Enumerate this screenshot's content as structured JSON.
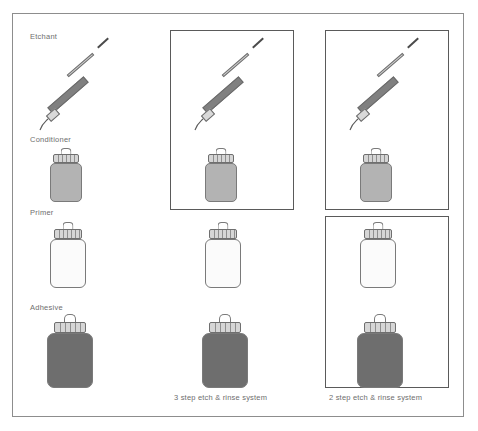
{
  "figure": {
    "title_visible": false,
    "border_color": "#8d8d8d",
    "background": "#ffffff"
  },
  "row_labels": [
    {
      "id": "etchant",
      "label": "Etchant"
    },
    {
      "id": "conditioner",
      "label": "Conditioner"
    },
    {
      "id": "primer",
      "label": "Primer"
    },
    {
      "id": "adhesive",
      "label": "Adhesive"
    }
  ],
  "columns": [
    {
      "id": "column-1",
      "caption": "",
      "boxed_groups": [],
      "items": [
        "etchant",
        "conditioner",
        "primer",
        "adhesive"
      ]
    },
    {
      "id": "column-2",
      "caption": "3 step etch & rinse system",
      "boxed_groups": [
        [
          "etchant",
          "conditioner"
        ]
      ],
      "items": [
        "etchant",
        "conditioner",
        "primer",
        "adhesive"
      ]
    },
    {
      "id": "column-3",
      "caption": "2 step etch & rinse system",
      "boxed_groups": [
        [
          "etchant",
          "conditioner"
        ],
        [
          "primer",
          "adhesive"
        ]
      ],
      "items": [
        "etchant",
        "conditioner",
        "primer",
        "adhesive"
      ]
    }
  ],
  "captions": {
    "column_2": "3 step etch & rinse system",
    "column_3": "2 step etch & rinse system"
  },
  "colors": {
    "etchant_barrel": "#808080",
    "conditioner_bottle": "#b3b3b3",
    "primer_bottle": "#fbfbfb",
    "adhesive_bottle": "#6e6e6e",
    "cap": "#d6d6d6",
    "outline": "#7a7a7a",
    "label_text": "#6e6e6e",
    "box_border": "#5a5a5a",
    "frame_border": "#8d8d8d"
  },
  "icons": {
    "syringe": "syringe-icon",
    "bottle": "bottle-icon"
  }
}
